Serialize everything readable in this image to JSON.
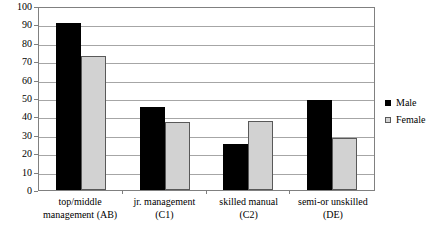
{
  "chart_data": {
    "type": "bar",
    "title": "",
    "subtitle": "",
    "xlabel": "",
    "ylabel": "",
    "ylim": [
      0,
      100
    ],
    "ytick_step": 10,
    "yticks": [
      100,
      90,
      80,
      70,
      60,
      50,
      40,
      30,
      20,
      10,
      0
    ],
    "grid": true,
    "grid_axis": "y",
    "legend_position": "right",
    "categories": [
      "top/middle management (AB)",
      "jr. management (C1)",
      "skilled manual (C2)",
      "semi-or unskilled (DE)"
    ],
    "category_lines": [
      {
        "l1": "top/middle",
        "l2": "management (AB)"
      },
      {
        "l1": "jr. management",
        "l2": "(C1)"
      },
      {
        "l1": "skilled manual",
        "l2": "(C2)"
      },
      {
        "l1": "semi-or unskilled",
        "l2": "(DE)"
      }
    ],
    "series": [
      {
        "name": "Male",
        "color": "#000000",
        "values": [
          91,
          45,
          25,
          49
        ]
      },
      {
        "name": "Female",
        "color": "#d2d2d2",
        "values": [
          73,
          37,
          37.5,
          28
        ]
      }
    ]
  },
  "legend": {
    "items": [
      {
        "label": "Male",
        "swatch": "male-swatch"
      },
      {
        "label": "Female",
        "swatch": "female-swatch"
      }
    ]
  }
}
